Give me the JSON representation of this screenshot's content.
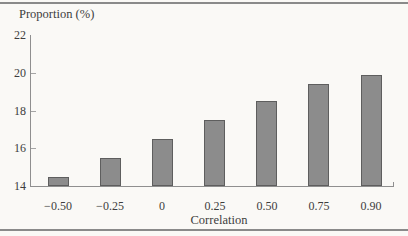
{
  "figure": {
    "rule_color": "#8a8a8a",
    "background": "#faf9f6",
    "axis_color": "#8f8f8f",
    "text_color": "#3d3d3d"
  },
  "chart_data": {
    "type": "bar",
    "title": "Proportion (%)",
    "xlabel": "Correlation",
    "ylabel": "",
    "categories": [
      "−0.50",
      "−0.25",
      "0",
      "0.25",
      "0.50",
      "0.75",
      "0.90"
    ],
    "values": [
      14.5,
      15.5,
      16.5,
      17.5,
      18.5,
      19.4,
      19.9
    ],
    "ylim": [
      14,
      22
    ],
    "yticks": [
      14,
      16,
      18,
      20,
      22
    ],
    "grid": "off",
    "legend": "none",
    "bar_color": "#8c8c8c",
    "bar_border_color": "#5e5e5e"
  }
}
